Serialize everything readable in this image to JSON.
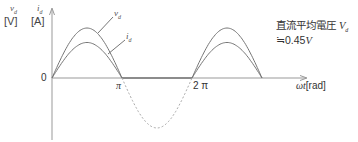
{
  "diagram": {
    "y_axis": {
      "var_voltage": "v",
      "var_voltage_sub": "d",
      "var_current": "i",
      "var_current_sub": "d",
      "unit_voltage": "[V]",
      "unit_current": "[A]"
    },
    "x_axis": {
      "label_var": "ωt",
      "label_unit": "[rad]",
      "origin": "0",
      "ticks": [
        "π",
        "2 π"
      ]
    },
    "curves": {
      "voltage_label": "v",
      "voltage_label_sub": "d",
      "current_label": "i",
      "current_label_sub": "d"
    },
    "annotation": {
      "line1_text": "直流平均電圧 ",
      "line1_var": "V",
      "line1_var_sub": "d",
      "line2_prefix": "≒0.45",
      "line2_var": "V"
    },
    "colors": {
      "curve": "#777777",
      "axis": "#999999",
      "dashed": "#aaaaaa"
    },
    "waveform": {
      "type": "half-wave rectified sine",
      "voltage_peak_rel": 1.0,
      "current_peak_rel": 0.71,
      "periods_shown": 1.5
    }
  }
}
